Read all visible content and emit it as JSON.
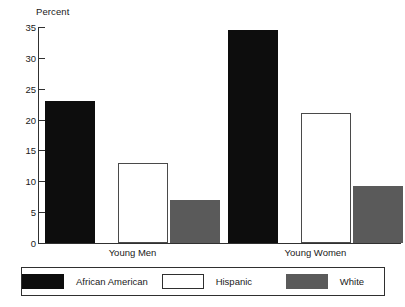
{
  "chart_data": {
    "type": "bar",
    "title": "",
    "xlabel": "",
    "ylabel": "Percent",
    "ylim": [
      0,
      35
    ],
    "ytick_step": 5,
    "yticks": [
      0,
      5,
      10,
      15,
      20,
      25,
      30,
      35
    ],
    "ytick_labels": [
      "0",
      "5",
      "10",
      "15",
      "20",
      "25",
      "30",
      "35"
    ],
    "grid": false,
    "legend_position": "bottom",
    "categories": [
      "Young Men",
      "Young Women"
    ],
    "series": [
      {
        "name": "African American",
        "color": "#0d0d0d",
        "values": [
          23,
          34.5
        ]
      },
      {
        "name": "Hispanic",
        "color": "#ffffff",
        "values": [
          13,
          21
        ]
      },
      {
        "name": "White",
        "color": "#5a5a5a",
        "values": [
          7,
          9.2
        ]
      }
    ]
  },
  "legend": {
    "entries": [
      {
        "label": "African American"
      },
      {
        "label": "Hispanic"
      },
      {
        "label": "White"
      }
    ]
  }
}
